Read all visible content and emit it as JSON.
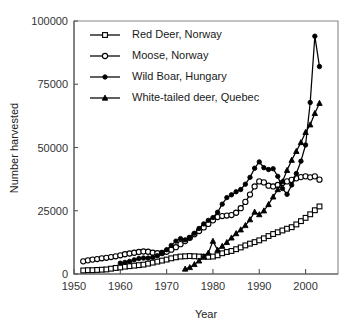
{
  "chart_data": {
    "type": "line",
    "title": "",
    "xlabel": "Year",
    "ylabel": "Number harvested",
    "xlim": [
      1950,
      2007
    ],
    "ylim": [
      0,
      100000
    ],
    "xticks": [
      1950,
      1960,
      1970,
      1980,
      1990,
      2000
    ],
    "yticks": [
      0,
      25000,
      50000,
      75000,
      100000
    ],
    "xtick_labels": [
      "1950",
      "1960",
      "1970",
      "1980",
      "1990",
      "2000"
    ],
    "ytick_labels": [
      "0",
      "25000",
      "50000",
      "75000",
      "100000"
    ],
    "grid": false,
    "legend_position": "top-left-inside",
    "series": [
      {
        "name": "Red Deer, Norway",
        "marker": "open-square",
        "x": [
          1952,
          1953,
          1954,
          1955,
          1956,
          1957,
          1958,
          1959,
          1960,
          1961,
          1962,
          1963,
          1964,
          1965,
          1966,
          1967,
          1968,
          1969,
          1970,
          1971,
          1972,
          1973,
          1974,
          1975,
          1976,
          1977,
          1978,
          1979,
          1980,
          1981,
          1982,
          1983,
          1984,
          1985,
          1986,
          1987,
          1988,
          1989,
          1990,
          1991,
          1992,
          1993,
          1994,
          1995,
          1996,
          1997,
          1998,
          1999,
          2000,
          2001,
          2002,
          2003
        ],
        "values": [
          1400,
          1500,
          1500,
          1600,
          1700,
          1800,
          2100,
          2400,
          2600,
          2900,
          3100,
          3300,
          3500,
          3700,
          4100,
          4500,
          4900,
          5300,
          5700,
          6200,
          6600,
          6900,
          7000,
          7100,
          7000,
          6900,
          6800,
          6800,
          6900,
          7400,
          8200,
          8700,
          9100,
          9800,
          10500,
          11300,
          12000,
          12600,
          13300,
          14100,
          15000,
          15800,
          16500,
          17200,
          17900,
          18500,
          19600,
          20900,
          22200,
          23600,
          25200,
          26700
        ]
      },
      {
        "name": "Moose, Norway",
        "marker": "open-circle",
        "x": [
          1952,
          1953,
          1954,
          1955,
          1956,
          1957,
          1958,
          1959,
          1960,
          1961,
          1962,
          1963,
          1964,
          1965,
          1966,
          1967,
          1968,
          1969,
          1970,
          1971,
          1972,
          1973,
          1974,
          1975,
          1976,
          1977,
          1978,
          1979,
          1980,
          1981,
          1982,
          1983,
          1984,
          1985,
          1986,
          1987,
          1988,
          1989,
          1990,
          1991,
          1992,
          1993,
          1994,
          1995,
          1996,
          1997,
          1998,
          1999,
          2000,
          2001,
          2002,
          2003
        ],
        "values": [
          5000,
          5400,
          5700,
          5900,
          6200,
          6400,
          6700,
          7000,
          7400,
          7800,
          8100,
          8400,
          8700,
          8900,
          8800,
          8400,
          8200,
          8300,
          8800,
          9600,
          10600,
          11800,
          13000,
          14300,
          15700,
          17000,
          18400,
          19800,
          21200,
          22500,
          22900,
          23100,
          23300,
          24200,
          26000,
          28500,
          31400,
          34600,
          36600,
          36200,
          34900,
          34600,
          35200,
          36000,
          36600,
          37200,
          37800,
          38300,
          38600,
          38200,
          38600,
          37300
        ]
      },
      {
        "name": "Wild Boar, Hungary",
        "marker": "solid-circle",
        "x": [
          1960,
          1961,
          1962,
          1963,
          1964,
          1965,
          1966,
          1967,
          1968,
          1969,
          1970,
          1971,
          1972,
          1973,
          1974,
          1975,
          1976,
          1977,
          1978,
          1979,
          1980,
          1981,
          1982,
          1983,
          1984,
          1985,
          1986,
          1987,
          1988,
          1989,
          1990,
          1991,
          1992,
          1993,
          1994,
          1995,
          1996,
          1997,
          1998,
          1999,
          2000,
          2001,
          2002,
          2003
        ],
        "values": [
          4300,
          4600,
          5000,
          5600,
          6100,
          6300,
          6300,
          6600,
          7200,
          8300,
          9600,
          11300,
          13000,
          14000,
          13500,
          14300,
          16100,
          18000,
          19800,
          21200,
          22300,
          24400,
          27600,
          30200,
          31300,
          32500,
          33400,
          35500,
          38200,
          41800,
          44300,
          42000,
          41300,
          41600,
          38600,
          33800,
          31500,
          35200,
          39700,
          44600,
          51000,
          67800,
          94000,
          82000
        ]
      },
      {
        "name": "White-tailed deer, Quebec",
        "marker": "solid-triangle",
        "x": [
          1974,
          1975,
          1976,
          1977,
          1978,
          1979,
          1980,
          1981,
          1982,
          1983,
          1984,
          1985,
          1986,
          1987,
          1988,
          1989,
          1990,
          1991,
          1992,
          1993,
          1994,
          1995,
          1996,
          1997,
          1998,
          1999,
          2000,
          2001,
          2002,
          2003
        ],
        "values": [
          2000,
          2600,
          3800,
          5200,
          6900,
          8300,
          13000,
          9500,
          11000,
          12500,
          14300,
          16000,
          17500,
          19200,
          21500,
          24500,
          23500,
          25000,
          27500,
          30500,
          33400,
          36500,
          41000,
          45000,
          48500,
          52000,
          56000,
          59000,
          63500,
          67500
        ]
      }
    ]
  },
  "legend": {
    "items": [
      {
        "label": "Red Deer, Norway",
        "marker": "open-square"
      },
      {
        "label": "Moose, Norway",
        "marker": "open-circle"
      },
      {
        "label": "Wild Boar, Hungary",
        "marker": "solid-circle"
      },
      {
        "label": "White-tailed deer, Quebec",
        "marker": "solid-triangle"
      }
    ]
  },
  "colors": {
    "ink": "#000000",
    "axis": "#555555",
    "frame": "#888888",
    "background": "#ffffff"
  }
}
